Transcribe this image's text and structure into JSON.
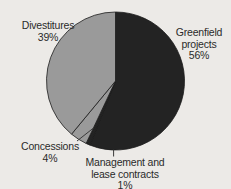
{
  "chart_data": {
    "type": "pie",
    "title": "",
    "subtitle": "",
    "xlabel": "",
    "ylabel": "",
    "legend_position": "none",
    "grid": false,
    "start_angle_deg": 0,
    "direction": "clockwise",
    "categories": [
      "Greenfield projects",
      "Management and lease contracts",
      "Concessions",
      "Divestitures"
    ],
    "values": [
      56,
      1,
      4,
      39
    ],
    "units": "%",
    "slices": [
      {
        "label": "Greenfield projects",
        "label_lines": [
          "Greenfield",
          "projects",
          "56%"
        ],
        "value": 56,
        "value_text": "56%",
        "color": "#232323"
      },
      {
        "label": "Management and lease contracts",
        "label_lines": [
          "Management and",
          "lease contracts",
          "1%"
        ],
        "value": 1,
        "value_text": "1%",
        "color": "#232323"
      },
      {
        "label": "Concessions",
        "label_lines": [
          "Concessions",
          "4%"
        ],
        "value": 4,
        "value_text": "4%",
        "color": "#9a9a9a"
      },
      {
        "label": "Divestitures",
        "label_lines": [
          "Divestitures",
          "39%"
        ],
        "value": 39,
        "value_text": "39%",
        "color": "#9a9a9a"
      }
    ]
  },
  "colors": {
    "background": "#eceae7",
    "text": "#2a2a2a",
    "dark_slice": "#232323",
    "gray_slice": "#9a9a9a",
    "slice_outline": "#1a1a1a",
    "leader_line": "#3a3a3a"
  },
  "labels": {
    "divestitures": {
      "line1": "Divestitures",
      "line2": "39%"
    },
    "greenfield": {
      "line1": "Greenfield",
      "line2": "projects",
      "line3": "56%"
    },
    "concessions": {
      "line1": "Concessions",
      "line2": "4%"
    },
    "management": {
      "line1": "Management and",
      "line2": "lease contracts",
      "line3": "1%"
    }
  }
}
